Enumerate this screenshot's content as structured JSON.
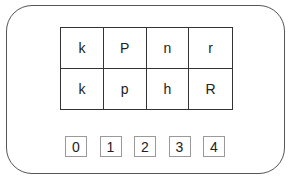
{
  "grid": {
    "rows": [
      [
        "k",
        "P",
        "n",
        "r"
      ],
      [
        "k",
        "p",
        "h",
        "R"
      ]
    ]
  },
  "options": [
    "0",
    "1",
    "2",
    "3",
    "4"
  ]
}
